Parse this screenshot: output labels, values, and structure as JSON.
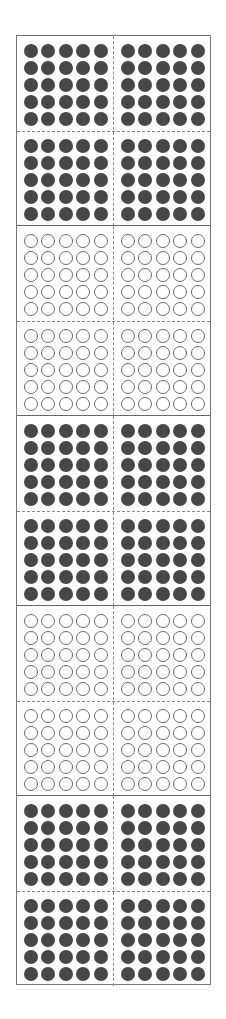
{
  "diagram": {
    "title": "",
    "colors": {
      "filled": "#474747",
      "empty_outline": "#6a6a6a",
      "frame": "#777777",
      "dashed": "#888888"
    },
    "blocks": [
      {
        "index": 1,
        "fill": "filled",
        "dots": 100
      },
      {
        "index": 2,
        "fill": "empty",
        "dots": 100
      },
      {
        "index": 3,
        "fill": "filled",
        "dots": 100
      },
      {
        "index": 4,
        "fill": "empty",
        "dots": 100
      },
      {
        "index": 5,
        "fill": "filled",
        "dots": 100
      }
    ],
    "totals": {
      "filled_dots": 300,
      "empty_dots": 200,
      "all_dots": 500
    }
  }
}
